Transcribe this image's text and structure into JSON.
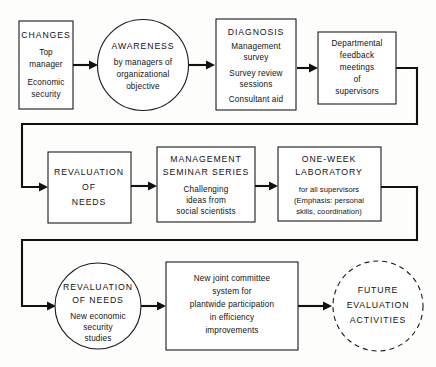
{
  "diagram": {
    "type": "flowchart",
    "colors": {
      "stroke": "#111111",
      "node_fill": "#ffffff",
      "background": "#fdfdfb"
    },
    "rows": [
      {
        "id": "row-1",
        "nodes": [
          "changes",
          "awareness",
          "diagnosis",
          "feedback"
        ]
      },
      {
        "id": "row-2",
        "nodes": [
          "revaluation1",
          "seminar",
          "laboratory"
        ]
      },
      {
        "id": "row-3",
        "nodes": [
          "revaluation2",
          "committee",
          "future"
        ]
      }
    ],
    "nodes": {
      "changes": {
        "shape": "rect",
        "heading": "CHANGES",
        "lines": [
          "Top",
          "manager",
          "Economic",
          "security"
        ]
      },
      "awareness": {
        "shape": "circle",
        "heading": "AWARENESS",
        "lines": [
          "by managers of",
          "organizational",
          "objective"
        ]
      },
      "diagnosis": {
        "shape": "rect",
        "heading": "DIAGNOSIS",
        "lines": [
          "Management",
          "survey",
          "Survey review",
          "sessions",
          "Consultant aid"
        ]
      },
      "feedback": {
        "shape": "rect",
        "heading": "",
        "lines": [
          "Departmental",
          "feedback",
          "meetings",
          "of",
          "supervisors"
        ]
      },
      "revaluation1": {
        "shape": "rect",
        "heading": "",
        "lines": [
          "REVALUATION",
          "OF",
          "NEEDS"
        ]
      },
      "seminar": {
        "shape": "rect",
        "heading": "",
        "lines": [
          "MANAGEMENT",
          "SEMINAR SERIES",
          "Challenging",
          "ideas from",
          "social scientists"
        ]
      },
      "laboratory": {
        "shape": "rect",
        "heading": "",
        "lines": [
          "ONE-WEEK",
          "LABORATORY",
          "for all supervisors",
          "(Emphasis: personal",
          "skills, coordination)"
        ]
      },
      "revaluation2": {
        "shape": "circle",
        "heading": "",
        "lines": [
          "REVALUATION",
          "OF NEEDS",
          "New economic",
          "security",
          "studies"
        ]
      },
      "committee": {
        "shape": "rect",
        "heading": "",
        "lines": [
          "New joint committee",
          "system for",
          "plantwide participation",
          "in efficiency",
          "improvements"
        ]
      },
      "future": {
        "shape": "circle-dashed",
        "heading": "",
        "lines": [
          "FUTURE",
          "EVALUATION",
          "ACTIVITIES"
        ]
      }
    },
    "connectors": [
      {
        "id": "changes-to-awareness",
        "from": "changes",
        "to": "awareness",
        "style": "arrow"
      },
      {
        "id": "awareness-to-diagnosis",
        "from": "awareness",
        "to": "diagnosis",
        "style": "arrow"
      },
      {
        "id": "diagnosis-to-feedback",
        "from": "diagnosis",
        "to": "feedback",
        "style": "arrow"
      },
      {
        "id": "feedback-to-revaluation1",
        "from": "feedback",
        "to": "revaluation1",
        "style": "wrap-arrow"
      },
      {
        "id": "revaluation1-to-seminar",
        "from": "revaluation1",
        "to": "seminar",
        "style": "arrow"
      },
      {
        "id": "seminar-to-laboratory",
        "from": "seminar",
        "to": "laboratory",
        "style": "arrow"
      },
      {
        "id": "laboratory-to-revaluation2",
        "from": "laboratory",
        "to": "revaluation2",
        "style": "wrap-arrow"
      },
      {
        "id": "revaluation2-to-committee",
        "from": "revaluation2",
        "to": "committee",
        "style": "arrow"
      },
      {
        "id": "committee-to-future",
        "from": "committee",
        "to": "future",
        "style": "arrow"
      }
    ]
  }
}
